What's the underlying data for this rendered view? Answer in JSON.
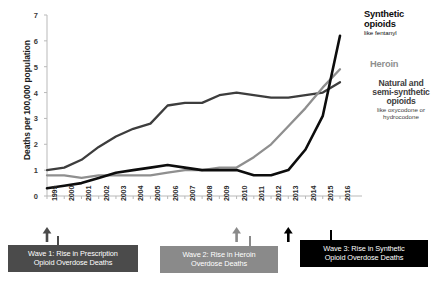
{
  "chart_data": {
    "type": "line",
    "title": "",
    "xlabel": "",
    "ylabel": "Deaths per 100,000 population",
    "ylim": [
      0,
      7
    ],
    "yticks": [
      "0",
      "1",
      "2",
      "3",
      "4",
      "5",
      "6",
      "7"
    ],
    "grid": false,
    "legend_position": "inline-right",
    "x": [
      "1999",
      "2000",
      "2001",
      "2002",
      "2003",
      "2004",
      "2005",
      "2006",
      "2007",
      "2008",
      "2009",
      "2010",
      "2011",
      "2012",
      "2013",
      "2014",
      "2015",
      "2016"
    ],
    "series": [
      {
        "name": "Synthetic opioids",
        "sublabel": "like fentanyl",
        "color": "#0d0d0d",
        "values": [
          0.3,
          0.4,
          0.5,
          0.7,
          0.9,
          1.0,
          1.1,
          1.2,
          1.1,
          1.0,
          1.0,
          1.0,
          0.8,
          0.8,
          1.0,
          1.8,
          3.1,
          6.2
        ]
      },
      {
        "name": "Heroin",
        "sublabel": "",
        "color": "#8f8f8f",
        "values": [
          0.8,
          0.8,
          0.7,
          0.8,
          0.8,
          0.8,
          0.8,
          0.9,
          1.0,
          1.0,
          1.1,
          1.1,
          1.5,
          2.0,
          2.7,
          3.4,
          4.2,
          4.9
        ]
      },
      {
        "name": "Natural and semi-synthetic opioids",
        "sublabel": "like oxycodone or hydrocodone",
        "color": "#3d3d3d",
        "values": [
          1.0,
          1.1,
          1.4,
          1.9,
          2.3,
          2.6,
          2.8,
          3.5,
          3.6,
          3.6,
          3.9,
          4.0,
          3.9,
          3.8,
          3.8,
          3.9,
          4.0,
          4.4
        ]
      }
    ],
    "annotations": [
      {
        "id": "wave-1",
        "text_line1": "Wave 1: Rise in Prescription",
        "text_line2": "Opioid Overdose Deaths",
        "anchor_year": "1999",
        "color": "#4b4b4b"
      },
      {
        "id": "wave-2",
        "text_line1": "Wave 2: Rise in Heroin",
        "text_line2": "Overdose Deaths",
        "anchor_year": "2010",
        "color": "#8a8a8a"
      },
      {
        "id": "wave-3",
        "text_line1": "Wave 3: Rise in Synthetic",
        "text_line2": "Opioid Overdose Deaths",
        "anchor_year": "2013",
        "color": "#000000"
      }
    ]
  }
}
